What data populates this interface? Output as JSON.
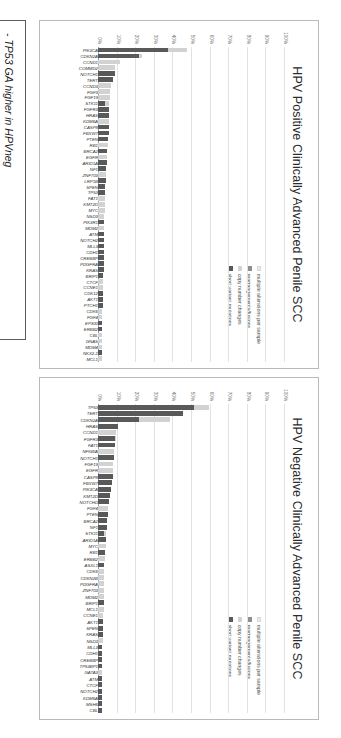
{
  "figure": {
    "legend_labels": {
      "multiple": "multiple alterations per sample",
      "rearrangements": "rearrangements/fusions",
      "copy_number": "copy number changes",
      "short_variant": "short variant mutations"
    },
    "colors": {
      "short_variant": "#595959",
      "copy_number": "#d2d2d2",
      "rearrangements": "#8e8e8e",
      "multiple": "#ededed",
      "box_border": "#5c5c5c",
      "panel_border": "#b9b9b9"
    },
    "notes": {
      "lines": [
        "- TP53 GA higher in HPVneg",
        "- TERT GA higher in HPVneg",
        "- PIK3CA GA higher in HPVpos",
        "- FGFR3 GA similar",
        "- NOTCH1 GA similar",
        "- MTAP del similar",
        "- MTOR targets similar"
      ],
      "sub_line": "(PTEN, NF1 others)"
    }
  },
  "chart_data": [
    {
      "type": "bar",
      "id": "hpv-positive",
      "title": "HPV Positive Clinically Advanced Penile SCC",
      "xlabel": "",
      "ylabel": "",
      "ylim": [
        0,
        100
      ],
      "yticks": [
        0,
        10,
        20,
        30,
        40,
        50,
        60,
        70,
        80,
        90,
        100
      ],
      "ytick_labels": [
        "0%",
        "10%",
        "20%",
        "30%",
        "40%",
        "50%",
        "60%",
        "70%",
        "80%",
        "90%",
        "100%"
      ],
      "grid": true,
      "legend_position": "upper right",
      "stacked": true,
      "series": [
        {
          "name": "short variant mutations",
          "color": "#595959"
        },
        {
          "name": "copy number changes",
          "color": "#d2d2d2"
        },
        {
          "name": "rearrangements/fusions",
          "color": "#8e8e8e"
        },
        {
          "name": "multiple alterations per sample",
          "color": "#ededed"
        }
      ],
      "categories": [
        "PIK3CA",
        "CDKN2A",
        "CCND1",
        "COMMD2",
        "NOTCH1",
        "TERT",
        "CCND3",
        "FGF3",
        "FGF19",
        "STK11",
        "FGFR3",
        "HRAS",
        "KDM6A",
        "CASP8",
        "FBXW7",
        "PTEN",
        "RB1",
        "BRCA2",
        "EGFR",
        "ARID1A",
        "NF1",
        "ZNF703",
        "LRP1B",
        "SPEN",
        "TP53",
        "FAT1",
        "KMT2D",
        "MYC",
        "NSD3",
        "PIK3R1",
        "MDM2",
        "ATM",
        "NOTCH2",
        "MLL3",
        "CDH1",
        "CREBBP",
        "PDGFRA",
        "KRAS",
        "BRIP1",
        "CTCF",
        "CCNE1",
        "CDK12",
        "AKT1",
        "PTCH1",
        "CDK6",
        "FGF4",
        "EP300",
        "ERBB2",
        "CBL",
        "GNAS",
        "MDM4",
        "NKX2-1",
        "MCL1"
      ],
      "values_stacked": [
        [
          38,
          10,
          0,
          0
        ],
        [
          22,
          2,
          0,
          0
        ],
        [
          0,
          12,
          0,
          0
        ],
        [
          0,
          9,
          0,
          0
        ],
        [
          9,
          0,
          0,
          0
        ],
        [
          8,
          0,
          0,
          0
        ],
        [
          0,
          7,
          0,
          0
        ],
        [
          0,
          6.5,
          0,
          0
        ],
        [
          0,
          6.5,
          0,
          0
        ],
        [
          4,
          2,
          0,
          0
        ],
        [
          6,
          0,
          0,
          0
        ],
        [
          6,
          0,
          0,
          0
        ],
        [
          0,
          6,
          0,
          0
        ],
        [
          6,
          0,
          0,
          0
        ],
        [
          6,
          0,
          0,
          0
        ],
        [
          5.5,
          0,
          0,
          0
        ],
        [
          0,
          5.5,
          0,
          0
        ],
        [
          5,
          0,
          0,
          0
        ],
        [
          0,
          5,
          0,
          0
        ],
        [
          5,
          0,
          0,
          0
        ],
        [
          4.5,
          0,
          0,
          0
        ],
        [
          0,
          4.5,
          0,
          0
        ],
        [
          4.5,
          0,
          0,
          0
        ],
        [
          4,
          0,
          0,
          0
        ],
        [
          4,
          0,
          0,
          0
        ],
        [
          0,
          4,
          0,
          0
        ],
        [
          0,
          4,
          0,
          0
        ],
        [
          0,
          4,
          0,
          0
        ],
        [
          0,
          3.5,
          0,
          0
        ],
        [
          3.5,
          0,
          0,
          0
        ],
        [
          0,
          3.5,
          0,
          0
        ],
        [
          3.5,
          0,
          0,
          0
        ],
        [
          3,
          0,
          0,
          0
        ],
        [
          3,
          0,
          0,
          0
        ],
        [
          3,
          0,
          0,
          0
        ],
        [
          3,
          0,
          0,
          0
        ],
        [
          3,
          0,
          0,
          0
        ],
        [
          3,
          0,
          0,
          0
        ],
        [
          2.5,
          0,
          0,
          0
        ],
        [
          0,
          2.5,
          0,
          0
        ],
        [
          0,
          2.5,
          0,
          0
        ],
        [
          2.5,
          0,
          0,
          0
        ],
        [
          2.5,
          0,
          0,
          0
        ],
        [
          2.5,
          0,
          0,
          0
        ],
        [
          0,
          2,
          0,
          0
        ],
        [
          0,
          2,
          0,
          0
        ],
        [
          2,
          0,
          0,
          0
        ],
        [
          2,
          0,
          0,
          0
        ],
        [
          0,
          2,
          0,
          0
        ],
        [
          0,
          2,
          0,
          0
        ],
        [
          0,
          2,
          0,
          0
        ],
        [
          2,
          0,
          0,
          0
        ],
        [
          0,
          2,
          0,
          0
        ]
      ]
    },
    {
      "type": "bar",
      "id": "hpv-negative",
      "title": "HPV Negative Clinically Advanced Penile SCC",
      "xlabel": "",
      "ylabel": "",
      "ylim": [
        0,
        100
      ],
      "yticks": [
        0,
        10,
        20,
        30,
        40,
        50,
        60,
        70,
        80,
        90,
        100
      ],
      "ytick_labels": [
        "0%",
        "10%",
        "20%",
        "30%",
        "40%",
        "50%",
        "60%",
        "70%",
        "80%",
        "90%",
        "100%"
      ],
      "grid": true,
      "legend_position": "upper right",
      "stacked": true,
      "series": [
        {
          "name": "short variant mutations",
          "color": "#595959"
        },
        {
          "name": "copy number changes",
          "color": "#d2d2d2"
        },
        {
          "name": "rearrangements/fusions",
          "color": "#8e8e8e"
        },
        {
          "name": "multiple alterations per sample",
          "color": "#ededed"
        }
      ],
      "categories": [
        "TP53",
        "TERT",
        "CDKN2A",
        "HRAS",
        "CCND1",
        "FGFR3",
        "FAT1",
        "NFKBIA",
        "NOTCH1",
        "FGF19",
        "EGFR",
        "CASP8",
        "FBXW7",
        "PIK3CA",
        "KMT2D",
        "NOTCHD",
        "FGF4",
        "PTEN",
        "BRCA2",
        "NF1",
        "STK11",
        "ARID1A",
        "MYC",
        "RB1",
        "ERBB2",
        "ASXL1",
        "CDK6",
        "CDKN2B",
        "PDGFRA",
        "ZNF703",
        "MDM2",
        "BRIP1",
        "MCL1",
        "CCNE1",
        "AKT1",
        "SPEN",
        "KRAS",
        "NSD3",
        "MLL3",
        "CDH1",
        "CREBBP",
        "TP53BP1",
        "GATA3",
        "ATM",
        "CTCF",
        "NOTCH2",
        "KDM6A",
        "MSH6",
        "CBL"
      ],
      "values_stacked": [
        [
          52,
          8,
          0,
          0
        ],
        [
          46,
          0,
          0,
          0
        ],
        [
          22,
          17,
          0,
          0
        ],
        [
          11,
          0,
          0,
          0
        ],
        [
          0,
          10,
          0,
          0
        ],
        [
          9,
          0.5,
          0,
          0
        ],
        [
          9,
          0,
          0,
          0
        ],
        [
          0,
          8.5,
          0,
          0
        ],
        [
          8.5,
          0,
          0,
          0
        ],
        [
          0,
          8,
          0,
          0
        ],
        [
          0,
          8,
          0,
          0
        ],
        [
          8,
          0,
          0,
          0
        ],
        [
          7.5,
          0,
          0,
          0
        ],
        [
          7,
          0,
          0,
          0
        ],
        [
          6.5,
          0,
          0,
          0
        ],
        [
          6,
          0,
          0,
          0
        ],
        [
          0,
          5.5,
          0,
          0
        ],
        [
          5.5,
          0,
          0,
          0
        ],
        [
          5,
          0,
          0,
          0
        ],
        [
          5,
          0,
          0,
          0
        ],
        [
          3.5,
          1,
          0,
          0
        ],
        [
          4.5,
          0,
          0,
          0
        ],
        [
          0,
          4.5,
          0,
          0
        ],
        [
          4,
          0,
          0,
          0
        ],
        [
          0,
          4,
          0,
          0
        ],
        [
          3.5,
          0,
          0,
          0
        ],
        [
          0,
          3.5,
          0,
          0
        ],
        [
          0,
          3.5,
          0,
          0
        ],
        [
          0,
          3,
          0,
          0
        ],
        [
          0,
          3,
          0,
          0
        ],
        [
          0,
          3,
          0,
          0
        ],
        [
          3,
          0,
          0,
          0
        ],
        [
          0,
          3,
          0,
          0
        ],
        [
          0,
          2.5,
          0,
          0
        ],
        [
          2.5,
          0,
          0,
          0
        ],
        [
          2.5,
          0,
          0,
          0
        ],
        [
          2.5,
          0,
          0,
          0
        ],
        [
          0,
          2.5,
          0,
          0
        ],
        [
          2,
          0,
          0,
          0
        ],
        [
          2,
          0,
          0,
          0
        ],
        [
          2,
          0,
          0,
          0
        ],
        [
          2,
          0,
          0,
          0
        ],
        [
          0,
          2,
          0,
          0
        ],
        [
          2,
          0,
          0,
          0
        ],
        [
          2,
          0,
          0,
          0
        ],
        [
          2,
          0,
          0,
          0
        ],
        [
          2,
          0,
          0,
          0
        ],
        [
          2,
          0,
          0,
          0
        ],
        [
          2,
          0,
          0,
          0
        ]
      ]
    }
  ]
}
